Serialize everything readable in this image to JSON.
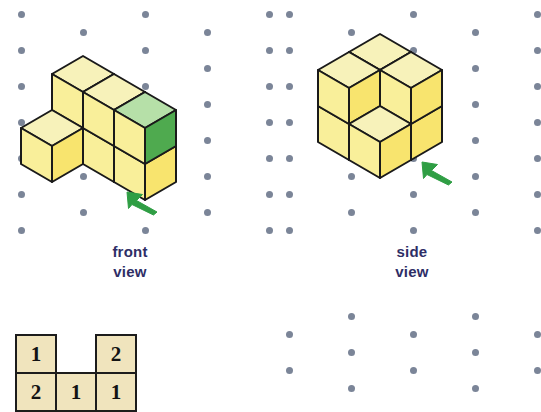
{
  "page": {
    "background_color": "#ffffff",
    "width": 538,
    "height": 391
  },
  "dot_grid": {
    "dot_color": "#7b8598",
    "dot_diameter": 7,
    "column_spacing": 62,
    "row_spacing": 36,
    "pattern": "isometric-staggered"
  },
  "colors": {
    "cube_top_face": "#f7f2ba",
    "cube_left_face": "#f9ef9a",
    "cube_right_face": "#f8e46e",
    "cube_outline": "#1a1a1a",
    "highlight_top_face": "#b6e0a8",
    "highlight_right_face": "#4faa4f",
    "arrow_color": "#2f9e44",
    "label_color": "#2e2e66",
    "grid_cell_fill": "#f0e4bd",
    "grid_cell_border": "#1c1c1c"
  },
  "panels": [
    {
      "id": "front-view-panel",
      "label_line1": "front",
      "label_line2": "view",
      "arrow": {
        "direction": "up-left",
        "color": "#2f9e44"
      },
      "cube_count": 6,
      "highlighted_cube": "top-right-front cube shown in green"
    },
    {
      "id": "side-view-panel",
      "label_line1": "side",
      "label_line2": "view",
      "arrow": {
        "direction": "up-left",
        "color": "#2f9e44"
      },
      "cube_count": 6,
      "highlighted_cube": null
    }
  ],
  "base_plan_grid": {
    "name": "base-plan-number-grid",
    "rows": [
      [
        "1",
        "",
        "2"
      ],
      [
        "2",
        "1",
        "1"
      ]
    ],
    "empty_marker": ""
  },
  "bottom_right_grid": {
    "present": true,
    "description": "empty isometric dot grid"
  }
}
